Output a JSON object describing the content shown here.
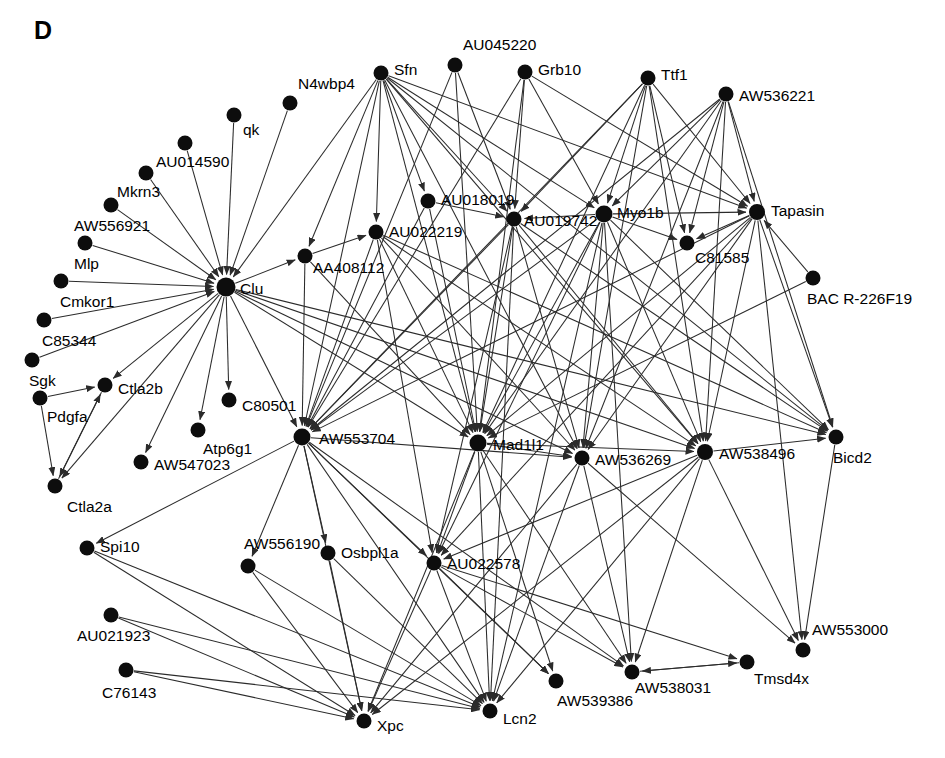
{
  "figure": {
    "panel_letter": "D",
    "width": 945,
    "height": 758,
    "background_color": "#ffffff",
    "node_color": "#0d0d0d",
    "edge_color": "#2b2b2b"
  },
  "chart_data": {
    "type": "diagram",
    "subtype": "directed-network-graph",
    "title": "",
    "xlabel": "",
    "ylabel": "",
    "grid": false,
    "legend": null,
    "panel_label": "D",
    "node_count": 44,
    "edge_count": 146,
    "nodes": [
      {
        "id": "Clu",
        "label": "Clu",
        "x": 226,
        "y": 287,
        "r": 9.5,
        "label_dx": 14,
        "label_dy": 3
      },
      {
        "id": "Sfn",
        "label": "Sfn",
        "x": 381,
        "y": 73,
        "r": 7.5,
        "label_dx": 13,
        "label_dy": -2
      },
      {
        "id": "AU045220",
        "label": "AU045220",
        "x": 455,
        "y": 65,
        "r": 7.5,
        "label_dx": 8,
        "label_dy": -19
      },
      {
        "id": "Grb10",
        "label": "Grb10",
        "x": 525,
        "y": 72,
        "r": 7.5,
        "label_dx": 13,
        "label_dy": -1
      },
      {
        "id": "Ttf1",
        "label": "Ttf1",
        "x": 648,
        "y": 78,
        "r": 7.5,
        "label_dx": 13,
        "label_dy": -2
      },
      {
        "id": "AW536221",
        "label": "AW536221",
        "x": 726,
        "y": 94,
        "r": 7.5,
        "label_dx": 13,
        "label_dy": 3
      },
      {
        "id": "N4wbp4",
        "label": "N4wbp4",
        "x": 290,
        "y": 103,
        "r": 7.5,
        "label_dx": 8,
        "label_dy": -18
      },
      {
        "id": "qk",
        "label": "qk",
        "x": 234,
        "y": 115,
        "r": 7.5,
        "label_dx": 9,
        "label_dy": 16
      },
      {
        "id": "AU014590",
        "label": "AU014590",
        "x": 185,
        "y": 143,
        "r": 7.5,
        "label_dx": -29,
        "label_dy": 20
      },
      {
        "id": "Mkrn3",
        "label": "Mkrn3",
        "x": 146,
        "y": 173,
        "r": 7.5,
        "label_dx": -29,
        "label_dy": 20
      },
      {
        "id": "AW556921",
        "label": "AW556921",
        "x": 111,
        "y": 205,
        "r": 7.5,
        "label_dx": -37,
        "label_dy": 22
      },
      {
        "id": "Mlp",
        "label": "Mlp",
        "x": 85,
        "y": 243,
        "r": 7.5,
        "label_dx": -11,
        "label_dy": 22
      },
      {
        "id": "Cmkor1",
        "label": "Cmkor1",
        "x": 61,
        "y": 281,
        "r": 7.5,
        "label_dx": -1,
        "label_dy": 22
      },
      {
        "id": "C85344",
        "label": "C85344",
        "x": 44,
        "y": 320,
        "r": 7.5,
        "label_dx": -2,
        "label_dy": 22
      },
      {
        "id": "Sgk",
        "label": "Sgk",
        "x": 32,
        "y": 360,
        "r": 7.5,
        "label_dx": -3,
        "label_dy": 22
      },
      {
        "id": "Pdgfa",
        "label": "Pdgfa",
        "x": 40,
        "y": 398,
        "r": 7.5,
        "label_dx": 7,
        "label_dy": 20
      },
      {
        "id": "Ctla2b",
        "label": "Ctla2b",
        "x": 105,
        "y": 385,
        "r": 7.5,
        "label_dx": 13,
        "label_dy": 5
      },
      {
        "id": "Ctla2a",
        "label": "Ctla2a",
        "x": 55,
        "y": 486,
        "r": 7.5,
        "label_dx": 0,
        "label_dy": 22
      },
      {
        "id": "AW547023",
        "label": "AW547023",
        "x": 141,
        "y": 462,
        "r": 7.5,
        "label_dx": 13,
        "label_dy": 4
      },
      {
        "id": "Atp6g1",
        "label": "Atp6g1",
        "x": 198,
        "y": 430,
        "r": 7.5,
        "label_dx": 5,
        "label_dy": 20
      },
      {
        "id": "C80501",
        "label": "C80501",
        "x": 229,
        "y": 400,
        "r": 7.5,
        "label_dx": 13,
        "label_dy": 7
      },
      {
        "id": "AA408112",
        "label": "AA408112",
        "x": 305,
        "y": 256,
        "r": 7.5,
        "label_dx": 8,
        "label_dy": 13
      },
      {
        "id": "AU022219",
        "label": "AU022219",
        "x": 376,
        "y": 232,
        "r": 7.5,
        "label_dx": 13,
        "label_dy": 1
      },
      {
        "id": "AU018019",
        "label": "AU018019",
        "x": 428,
        "y": 201,
        "r": 7.5,
        "label_dx": 13,
        "label_dy": 0
      },
      {
        "id": "AU019742",
        "label": "AU019742",
        "x": 514,
        "y": 219,
        "r": 7.5,
        "label_dx": 10,
        "label_dy": 3
      },
      {
        "id": "Myo1b",
        "label": "Myo1b",
        "x": 604,
        "y": 214,
        "r": 8.5,
        "label_dx": 13,
        "label_dy": 0
      },
      {
        "id": "Tapasin",
        "label": "Tapasin",
        "x": 757,
        "y": 212,
        "r": 8.0,
        "label_dx": 14,
        "label_dy": 0
      },
      {
        "id": "C81585",
        "label": "C81585",
        "x": 687,
        "y": 243,
        "r": 7.5,
        "label_dx": 8,
        "label_dy": 16
      },
      {
        "id": "BACR226F19",
        "label": "BAC R-226F19",
        "x": 813,
        "y": 278,
        "r": 7.5,
        "label_dx": -6,
        "label_dy": 22
      },
      {
        "id": "AW553704",
        "label": "AW553704",
        "x": 302,
        "y": 437,
        "r": 8.5,
        "label_dx": 17,
        "label_dy": 3
      },
      {
        "id": "Mad1l1",
        "label": "Mad1l1",
        "x": 478,
        "y": 443,
        "r": 8.5,
        "label_dx": 15,
        "label_dy": 3
      },
      {
        "id": "AW536269",
        "label": "AW536269",
        "x": 582,
        "y": 458,
        "r": 7.5,
        "label_dx": 13,
        "label_dy": 3
      },
      {
        "id": "AW538496",
        "label": "AW538496",
        "x": 705,
        "y": 452,
        "r": 8.0,
        "label_dx": 14,
        "label_dy": 3
      },
      {
        "id": "Bicd2",
        "label": "Bicd2",
        "x": 836,
        "y": 437,
        "r": 7.5,
        "label_dx": -3,
        "label_dy": 22
      },
      {
        "id": "Spi10",
        "label": "Spi10",
        "x": 87,
        "y": 548,
        "r": 7.5,
        "label_dx": 13,
        "label_dy": 0
      },
      {
        "id": "AW556190",
        "label": "AW556190",
        "x": 248,
        "y": 566,
        "r": 7.5,
        "label_dx": -4,
        "label_dy": -21
      },
      {
        "id": "Osbpl1a",
        "label": "Osbpl1a",
        "x": 328,
        "y": 553,
        "r": 7.5,
        "label_dx": 13,
        "label_dy": 1
      },
      {
        "id": "AU022578",
        "label": "AU022578",
        "x": 434,
        "y": 563,
        "r": 7.5,
        "label_dx": 13,
        "label_dy": 2
      },
      {
        "id": "AU021923",
        "label": "AU021923",
        "x": 111,
        "y": 615,
        "r": 7.5,
        "label_dx": -34,
        "label_dy": 22
      },
      {
        "id": "C76143",
        "label": "C76143",
        "x": 126,
        "y": 670,
        "r": 7.5,
        "label_dx": -24,
        "label_dy": 24
      },
      {
        "id": "Xpc",
        "label": "Xpc",
        "x": 364,
        "y": 721,
        "r": 7.5,
        "label_dx": 13,
        "label_dy": 6
      },
      {
        "id": "Lcn2",
        "label": "Lcn2",
        "x": 490,
        "y": 711,
        "r": 7.5,
        "label_dx": 13,
        "label_dy": 9
      },
      {
        "id": "AW539386",
        "label": "AW539386",
        "x": 556,
        "y": 681,
        "r": 7.5,
        "label_dx": 1,
        "label_dy": 21
      },
      {
        "id": "AW538031",
        "label": "AW538031",
        "x": 632,
        "y": 672,
        "r": 7.5,
        "label_dx": 3,
        "label_dy": 17
      },
      {
        "id": "Tmsd4x",
        "label": "Tmsd4x",
        "x": 747,
        "y": 662,
        "r": 7.5,
        "label_dx": 7,
        "label_dy": 18
      },
      {
        "id": "AW553000",
        "label": "AW553000",
        "x": 803,
        "y": 650,
        "r": 7.5,
        "label_dx": 9,
        "label_dy": -19
      }
    ],
    "edges": [
      {
        "source": "qk",
        "target": "Clu"
      },
      {
        "source": "AU014590",
        "target": "Clu"
      },
      {
        "source": "Mkrn3",
        "target": "Clu"
      },
      {
        "source": "AW556921",
        "target": "Clu"
      },
      {
        "source": "Mlp",
        "target": "Clu"
      },
      {
        "source": "Cmkor1",
        "target": "Clu"
      },
      {
        "source": "C85344",
        "target": "Clu"
      },
      {
        "source": "Sgk",
        "target": "Clu"
      },
      {
        "source": "N4wbp4",
        "target": "Clu"
      },
      {
        "source": "Sfn",
        "target": "Clu"
      },
      {
        "source": "Clu",
        "target": "Ctla2b"
      },
      {
        "source": "Clu",
        "target": "Ctla2a"
      },
      {
        "source": "Clu",
        "target": "AW547023"
      },
      {
        "source": "Clu",
        "target": "Atp6g1"
      },
      {
        "source": "Clu",
        "target": "C80501"
      },
      {
        "source": "Clu",
        "target": "AW553704"
      },
      {
        "source": "Clu",
        "target": "Mad1l1"
      },
      {
        "source": "Clu",
        "target": "AW536269"
      },
      {
        "source": "Clu",
        "target": "Bicd2"
      },
      {
        "source": "Clu",
        "target": "AA408112"
      },
      {
        "source": "Pdgfa",
        "target": "Ctla2a"
      },
      {
        "source": "Pdgfa",
        "target": "Ctla2b"
      },
      {
        "source": "Ctla2b",
        "target": "Ctla2a"
      },
      {
        "source": "Ctla2a",
        "target": "Ctla2b"
      },
      {
        "source": "Sfn",
        "target": "AU022219"
      },
      {
        "source": "Sfn",
        "target": "AU018019"
      },
      {
        "source": "Sfn",
        "target": "AU019742"
      },
      {
        "source": "Sfn",
        "target": "Myo1b"
      },
      {
        "source": "Sfn",
        "target": "Tapasin"
      },
      {
        "source": "Sfn",
        "target": "AW553704"
      },
      {
        "source": "Sfn",
        "target": "Mad1l1"
      },
      {
        "source": "Sfn",
        "target": "AW538496"
      },
      {
        "source": "Sfn",
        "target": "Bicd2"
      },
      {
        "source": "Sfn",
        "target": "AA408112"
      },
      {
        "source": "AU045220",
        "target": "AU019742"
      },
      {
        "source": "AU045220",
        "target": "AW553704"
      },
      {
        "source": "Grb10",
        "target": "AU019742"
      },
      {
        "source": "Grb10",
        "target": "Myo1b"
      },
      {
        "source": "Grb10",
        "target": "AW553704"
      },
      {
        "source": "Grb10",
        "target": "Mad1l1"
      },
      {
        "source": "Ttf1",
        "target": "Myo1b"
      },
      {
        "source": "Ttf1",
        "target": "Tapasin"
      },
      {
        "source": "Ttf1",
        "target": "C81585"
      },
      {
        "source": "Ttf1",
        "target": "AU019742"
      },
      {
        "source": "Ttf1",
        "target": "AW553704"
      },
      {
        "source": "Ttf1",
        "target": "Mad1l1"
      },
      {
        "source": "Ttf1",
        "target": "AW538496"
      },
      {
        "source": "AW536221",
        "target": "Tapasin"
      },
      {
        "source": "AW536221",
        "target": "C81585"
      },
      {
        "source": "AW536221",
        "target": "Myo1b"
      },
      {
        "source": "AW536221",
        "target": "AW553704"
      },
      {
        "source": "AW536221",
        "target": "Mad1l1"
      },
      {
        "source": "AW536221",
        "target": "AW538496"
      },
      {
        "source": "AW536221",
        "target": "Bicd2"
      },
      {
        "source": "Myo1b",
        "target": "Tapasin"
      },
      {
        "source": "Myo1b",
        "target": "C81585"
      },
      {
        "source": "Myo1b",
        "target": "AU019742"
      },
      {
        "source": "Myo1b",
        "target": "AW553704"
      },
      {
        "source": "Myo1b",
        "target": "Mad1l1"
      },
      {
        "source": "Myo1b",
        "target": "AW536269"
      },
      {
        "source": "Myo1b",
        "target": "AW538496"
      },
      {
        "source": "Myo1b",
        "target": "Bicd2"
      },
      {
        "source": "Myo1b",
        "target": "AU022578"
      },
      {
        "source": "Tapasin",
        "target": "C81585"
      },
      {
        "source": "Tapasin",
        "target": "AW538496"
      },
      {
        "source": "Tapasin",
        "target": "Bicd2"
      },
      {
        "source": "Tapasin",
        "target": "AW536269"
      },
      {
        "source": "Tapasin",
        "target": "Mad1l1"
      },
      {
        "source": "Tapasin",
        "target": "AW553000"
      },
      {
        "source": "BACR226F19",
        "target": "Tapasin"
      },
      {
        "source": "BACR226F19",
        "target": "Mad1l1"
      },
      {
        "source": "AU018019",
        "target": "AU019742"
      },
      {
        "source": "AU018019",
        "target": "AW553704"
      },
      {
        "source": "AU018019",
        "target": "Mad1l1"
      },
      {
        "source": "AU019742",
        "target": "AW553704"
      },
      {
        "source": "AU019742",
        "target": "Mad1l1"
      },
      {
        "source": "AU019742",
        "target": "AW536269"
      },
      {
        "source": "AU019742",
        "target": "AW538496"
      },
      {
        "source": "AU019742",
        "target": "AU022578"
      },
      {
        "source": "AU022219",
        "target": "AW553704"
      },
      {
        "source": "AU022219",
        "target": "Mad1l1"
      },
      {
        "source": "AU022219",
        "target": "AW536269"
      },
      {
        "source": "AU022219",
        "target": "AW538496"
      },
      {
        "source": "AU022219",
        "target": "Bicd2"
      },
      {
        "source": "AA408112",
        "target": "AW553704"
      },
      {
        "source": "AA408112",
        "target": "AU022219"
      },
      {
        "source": "AA408112",
        "target": "Mad1l1"
      },
      {
        "source": "AW553704",
        "target": "AW556190"
      },
      {
        "source": "AW553704",
        "target": "Osbpl1a"
      },
      {
        "source": "AW553704",
        "target": "AU022578"
      },
      {
        "source": "AW553704",
        "target": "Spi10"
      },
      {
        "source": "AW553704",
        "target": "Xpc"
      },
      {
        "source": "AW553704",
        "target": "Lcn2"
      },
      {
        "source": "AW553704",
        "target": "AW538031"
      },
      {
        "source": "AW553704",
        "target": "AW536269"
      },
      {
        "source": "Mad1l1",
        "target": "AW536269"
      },
      {
        "source": "Mad1l1",
        "target": "AW538496"
      },
      {
        "source": "Mad1l1",
        "target": "AU022578"
      },
      {
        "source": "Mad1l1",
        "target": "Lcn2"
      },
      {
        "source": "Mad1l1",
        "target": "AW539386"
      },
      {
        "source": "Mad1l1",
        "target": "Xpc"
      },
      {
        "source": "AW536269",
        "target": "AW538031"
      },
      {
        "source": "AW536269",
        "target": "Lcn2"
      },
      {
        "source": "AW536269",
        "target": "AW553000"
      },
      {
        "source": "AW538496",
        "target": "Bicd2"
      },
      {
        "source": "AW538496",
        "target": "AW553000"
      },
      {
        "source": "AW538496",
        "target": "AW538031"
      },
      {
        "source": "AW538496",
        "target": "Lcn2"
      },
      {
        "source": "AW538496",
        "target": "Xpc"
      },
      {
        "source": "Bicd2",
        "target": "AW553000"
      },
      {
        "source": "AU022578",
        "target": "Xpc"
      },
      {
        "source": "AU022578",
        "target": "Lcn2"
      },
      {
        "source": "AU022578",
        "target": "AW538031"
      },
      {
        "source": "AU022578",
        "target": "Tmsd4x"
      },
      {
        "source": "AU022578",
        "target": "AW539386"
      },
      {
        "source": "Osbpl1a",
        "target": "Xpc"
      },
      {
        "source": "Osbpl1a",
        "target": "Lcn2"
      },
      {
        "source": "AW556190",
        "target": "Xpc"
      },
      {
        "source": "AW556190",
        "target": "Lcn2"
      },
      {
        "source": "Spi10",
        "target": "Xpc"
      },
      {
        "source": "Spi10",
        "target": "Lcn2"
      },
      {
        "source": "AU021923",
        "target": "Xpc"
      },
      {
        "source": "AU021923",
        "target": "Lcn2"
      },
      {
        "source": "C76143",
        "target": "Xpc"
      },
      {
        "source": "C76143",
        "target": "Lcn2"
      },
      {
        "source": "AW538031",
        "target": "Tmsd4x"
      },
      {
        "source": "Tmsd4x",
        "target": "AW538031"
      },
      {
        "source": "AW538496",
        "target": "AU022578"
      },
      {
        "source": "AW536221",
        "target": "AW536269"
      },
      {
        "source": "Ttf1",
        "target": "AW536269"
      },
      {
        "source": "Grb10",
        "target": "Tapasin"
      },
      {
        "source": "AU045220",
        "target": "Mad1l1"
      },
      {
        "source": "Sfn",
        "target": "AW536269"
      },
      {
        "source": "Myo1b",
        "target": "AW538031"
      },
      {
        "source": "AU019742",
        "target": "Bicd2"
      },
      {
        "source": "Tapasin",
        "target": "AW553704"
      },
      {
        "source": "AU022219",
        "target": "AU022578"
      },
      {
        "source": "AW553704",
        "target": "AW539386"
      },
      {
        "source": "Mad1l1",
        "target": "AW538031"
      },
      {
        "source": "AU019742",
        "target": "Lcn2"
      },
      {
        "source": "AW536269",
        "target": "Xpc"
      },
      {
        "source": "Clu",
        "target": "AW538496"
      },
      {
        "source": "Myo1b",
        "target": "Lcn2"
      },
      {
        "source": "Tapasin",
        "target": "AU022578"
      }
    ]
  }
}
